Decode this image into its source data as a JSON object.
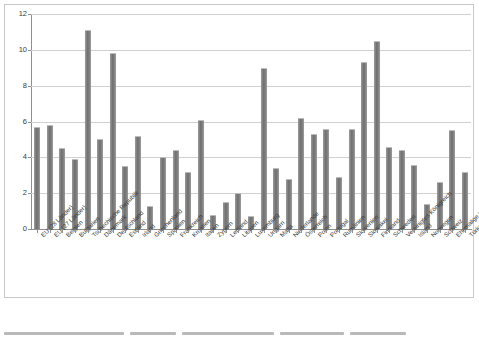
{
  "chart_data": {
    "type": "bar",
    "title": "",
    "subtitle": "",
    "xlabel": "",
    "ylabel": "",
    "ylim": [
      0,
      12
    ],
    "yticks": [
      0,
      2,
      4,
      6,
      8,
      10,
      12
    ],
    "ytick_labels": [
      "0",
      "2",
      "4",
      "6",
      "8",
      "10",
      "12"
    ],
    "grid": "horizontal",
    "legend": "none",
    "bar_color": "#7d7d7d",
    "categories": [
      "EU (28 Länder)",
      "EU (27 Länder)",
      "Belgien",
      "Bulgarien",
      "Tschechische Republik",
      "Dänemark",
      "Deutschland",
      "Estland",
      "Irland",
      "Griechenland",
      "Spanien",
      "Frankreich",
      "Kroatien",
      "Italien",
      "Zypern",
      "Lettland",
      "Litauen",
      "Luxemburg",
      "Ungarn",
      "Malta",
      "Niederlande",
      "Österreich",
      "Polen",
      "Portugal",
      "Rumänien",
      "Slowenien",
      "Slowakei",
      "Finnland",
      "Schweden",
      "Vereinigtes Königreich",
      "Island",
      "Norwegen",
      "Schweiz",
      "Ehemalige jugosl. Republik Mazedonien",
      "Türkei"
    ],
    "values": [
      5.7,
      5.8,
      4.5,
      3.9,
      11.1,
      5.0,
      9.8,
      3.5,
      5.2,
      1.3,
      4.0,
      4.4,
      3.2,
      6.1,
      0.8,
      1.5,
      2.0,
      0.7,
      9.0,
      3.4,
      2.8,
      6.2,
      5.3,
      5.6,
      2.9,
      5.6,
      9.3,
      10.5,
      4.6,
      4.4,
      3.6,
      1.4,
      2.6,
      5.5,
      3.2
    ]
  },
  "caption": {
    "line1": "",
    "line2": ""
  }
}
